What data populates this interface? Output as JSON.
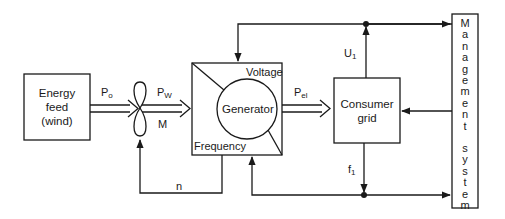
{
  "diagram": {
    "blocks": {
      "energy_feed": {
        "line1": "Energy",
        "line2": "feed",
        "line3": "(wind)"
      },
      "generator": {
        "label": "Generator",
        "corner_top": "Voltage",
        "corner_bottom": "Frequency"
      },
      "consumer_grid": {
        "line1": "Consumer",
        "line2": "grid"
      },
      "management_system": {
        "label": "Management system",
        "letters": [
          "M",
          "a",
          "n",
          "a",
          "g",
          "e",
          "m",
          "e",
          "n",
          "t",
          " ",
          "s",
          "y",
          "s",
          "t",
          "e",
          "m"
        ]
      }
    },
    "signals": {
      "p0": {
        "main": "P",
        "sub": "o"
      },
      "pw": {
        "main": "P",
        "sub": "W"
      },
      "m": {
        "main": "M"
      },
      "pel": {
        "main": "P",
        "sub": "el"
      },
      "u1": {
        "main": "U",
        "sub": "1"
      },
      "f1": {
        "main": "f",
        "sub": "1"
      },
      "n": {
        "main": "n"
      }
    },
    "stroke_color": "#1a1a1a",
    "background_color": "#ffffff"
  }
}
